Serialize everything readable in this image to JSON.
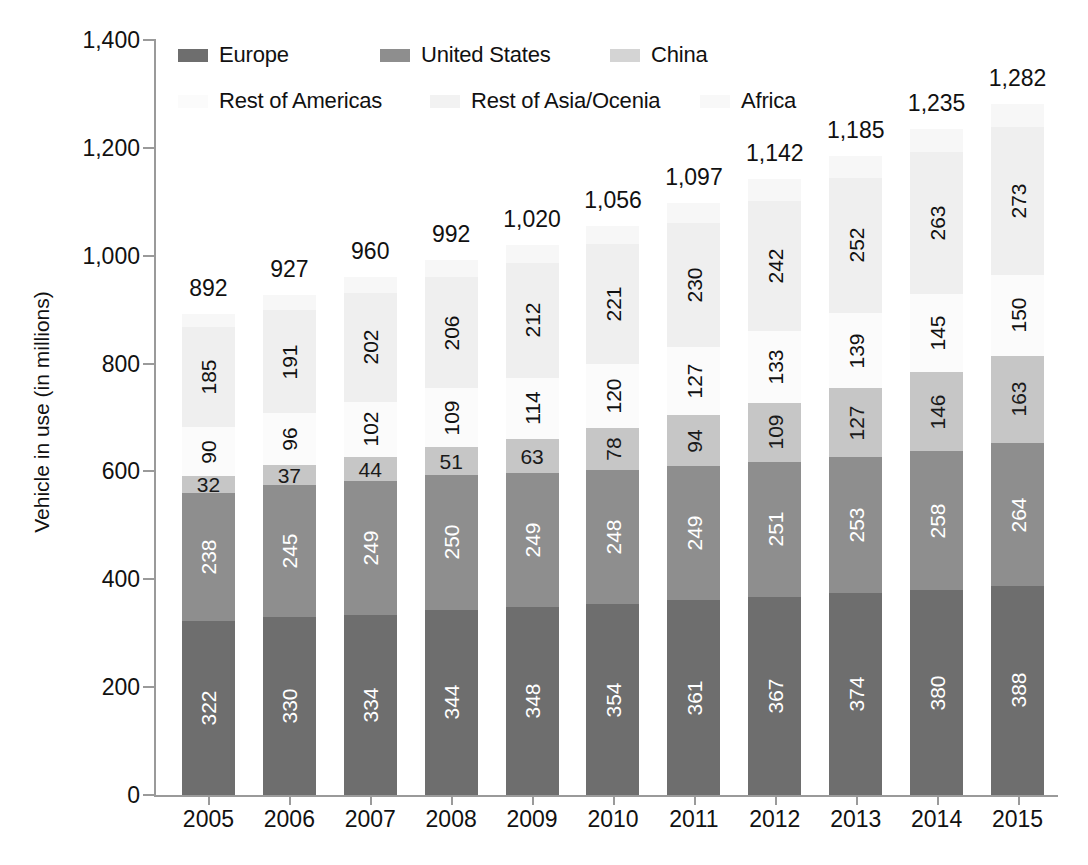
{
  "chart_data": {
    "type": "bar",
    "subtype": "stacked-bar",
    "title": "",
    "xlabel": "",
    "ylabel": "Vehicle in use (in millions)",
    "ylim": [
      0,
      1400
    ],
    "ytick_step": 200,
    "ytick_labels": [
      "0",
      "200",
      "400",
      "600",
      "800",
      "1,000",
      "1,200",
      "1,400"
    ],
    "grid": false,
    "legend_position": "top",
    "categories": [
      "2005",
      "2006",
      "2007",
      "2008",
      "2009",
      "2010",
      "2011",
      "2012",
      "2013",
      "2014",
      "2015"
    ],
    "series": [
      {
        "name": "Europe",
        "color": "#6e6e6e",
        "label_color": "#ffffff",
        "values": [
          322,
          330,
          334,
          344,
          348,
          354,
          361,
          367,
          374,
          380,
          388
        ]
      },
      {
        "name": "United States",
        "color": "#8e8e8e",
        "label_color": "#ffffff",
        "values": [
          238,
          245,
          249,
          250,
          249,
          248,
          249,
          251,
          253,
          258,
          264
        ]
      },
      {
        "name": "China",
        "color": "#c6c6c6",
        "label_color": "#1a1a1a",
        "values": [
          32,
          37,
          44,
          51,
          63,
          78,
          94,
          109,
          127,
          146,
          163
        ]
      },
      {
        "name": "Rest of Americas",
        "color": "#fbfbfb",
        "label_color": "#111111",
        "values": [
          90,
          96,
          102,
          109,
          114,
          120,
          127,
          133,
          139,
          145,
          150
        ]
      },
      {
        "name": "Rest of Asia/Ocenia",
        "color": "#efefef",
        "label_color": "#111111",
        "values": [
          185,
          191,
          202,
          206,
          212,
          221,
          230,
          242,
          252,
          263,
          273
        ]
      },
      {
        "name": "Africa",
        "color": "#f7f7f7",
        "label_color": "#111111",
        "values": [
          25,
          28,
          29,
          32,
          34,
          35,
          36,
          40,
          40,
          43,
          44
        ]
      }
    ],
    "totals": [
      892,
      927,
      960,
      992,
      1020,
      1056,
      1097,
      1142,
      1185,
      1235,
      1282
    ],
    "total_labels": [
      "892",
      "927",
      "960",
      "992",
      "1,020",
      "1,056",
      "1,097",
      "1,142",
      "1,185",
      "1,235",
      "1,282"
    ]
  },
  "legend": {
    "row1": [
      {
        "label": "Europe",
        "color": "#6e6e6e",
        "left": 178,
        "top": 42
      },
      {
        "label": "United States",
        "color": "#8e8e8e",
        "left": 380,
        "top": 42
      },
      {
        "label": "China",
        "color": "#d4d4d4",
        "left": 610,
        "top": 42
      }
    ],
    "row2": [
      {
        "label": "Rest of Americas",
        "color": "#fbfbfb",
        "left": 178,
        "top": 88
      },
      {
        "label": "Rest of Asia/Ocenia",
        "color": "#f2f2f2",
        "left": 430,
        "top": 88
      },
      {
        "label": "Africa",
        "color": "#f8f8f8",
        "left": 700,
        "top": 88
      }
    ]
  },
  "axis": {
    "y_title": "Vehicle in use (in millions)"
  }
}
